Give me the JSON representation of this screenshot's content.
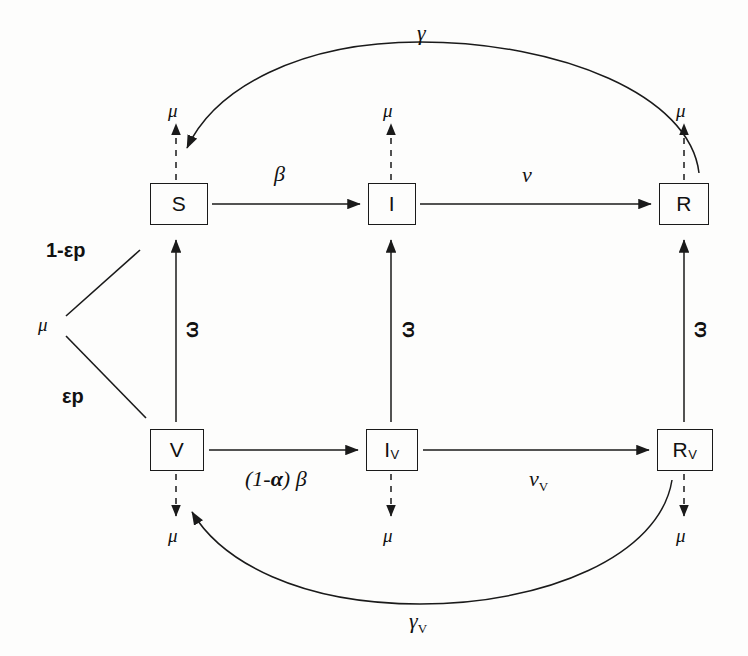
{
  "diagram": {
    "type": "compartmental-flow",
    "stroke_color": "#1a1a1a",
    "background_color": "#fdfdfc",
    "nodes": [
      {
        "id": "S",
        "label": "S",
        "sub": "",
        "x": 150,
        "y": 183,
        "w": 56,
        "h": 40
      },
      {
        "id": "I",
        "label": "I",
        "sub": "",
        "x": 368,
        "y": 183,
        "w": 46,
        "h": 40
      },
      {
        "id": "R",
        "label": "R",
        "sub": "",
        "x": 659,
        "y": 183,
        "w": 48,
        "h": 40
      },
      {
        "id": "V",
        "label": "V",
        "sub": "",
        "x": 150,
        "y": 429,
        "w": 52,
        "h": 40
      },
      {
        "id": "IV",
        "label": "I",
        "sub": "V",
        "x": 366,
        "y": 429,
        "w": 50,
        "h": 40
      },
      {
        "id": "RV",
        "label": "R",
        "sub": "V",
        "x": 657,
        "y": 429,
        "w": 54,
        "h": 40
      }
    ],
    "labels": {
      "birth_mu": "μ",
      "branch_unvaccinated": "1-εp",
      "branch_vaccinated": "εp",
      "infection_top": "β",
      "infection_bottom_prefix": "(1-",
      "infection_bottom_alpha": "α",
      "infection_bottom_suffix": ") ",
      "infection_bottom_beta": "β",
      "recovery_top": "ν",
      "recovery_bottom": "ν",
      "recovery_bottom_sub": "V",
      "waning_top": "γ",
      "waning_bottom": "γ",
      "waning_bottom_sub": "V",
      "vaccine_waning": "ω",
      "death_mu": "μ"
    },
    "death_labels": [
      {
        "for": "S",
        "text": "μ",
        "x": 167,
        "y": 103
      },
      {
        "for": "I",
        "text": "μ",
        "x": 385,
        "y": 103
      },
      {
        "for": "R",
        "text": "μ",
        "x": 676,
        "y": 103
      },
      {
        "for": "V",
        "text": "μ",
        "x": 167,
        "y": 528
      },
      {
        "for": "IV",
        "text": "μ",
        "x": 385,
        "y": 528
      },
      {
        "for": "RV",
        "text": "μ",
        "x": 676,
        "y": 528
      }
    ],
    "waning_labels": [
      {
        "for": "S-V",
        "text": "ω",
        "x": 183,
        "y": 325
      },
      {
        "for": "I-IV",
        "text": "ω",
        "x": 401,
        "y": 325
      },
      {
        "for": "R-RV",
        "text": "ω",
        "x": 692,
        "y": 325
      }
    ],
    "edges": [
      {
        "from": "birth",
        "to": "S",
        "rate": "1-εp",
        "style": "solid-line"
      },
      {
        "from": "birth",
        "to": "V",
        "rate": "εp",
        "style": "solid-line"
      },
      {
        "from": "S",
        "to": "I",
        "rate": "β",
        "style": "arrow"
      },
      {
        "from": "I",
        "to": "R",
        "rate": "ν",
        "style": "arrow"
      },
      {
        "from": "V",
        "to": "IV",
        "rate": "(1-α)β",
        "style": "arrow"
      },
      {
        "from": "IV",
        "to": "RV",
        "rate": "ν_V",
        "style": "arrow"
      },
      {
        "from": "V",
        "to": "S",
        "rate": "ω",
        "style": "arrow-up"
      },
      {
        "from": "IV",
        "to": "I",
        "rate": "ω",
        "style": "arrow-up"
      },
      {
        "from": "RV",
        "to": "R",
        "rate": "ω",
        "style": "arrow-up"
      },
      {
        "from": "R",
        "to": "S",
        "rate": "γ",
        "style": "curved-arrow"
      },
      {
        "from": "RV",
        "to": "V",
        "rate": "γ_V",
        "style": "curved-arrow"
      },
      {
        "from": "S",
        "to": "death",
        "rate": "μ",
        "style": "dashed-arrow"
      },
      {
        "from": "I",
        "to": "death",
        "rate": "μ",
        "style": "dashed-arrow"
      },
      {
        "from": "R",
        "to": "death",
        "rate": "μ",
        "style": "dashed-arrow"
      },
      {
        "from": "V",
        "to": "death",
        "rate": "μ",
        "style": "dashed-arrow"
      },
      {
        "from": "IV",
        "to": "death",
        "rate": "μ",
        "style": "dashed-arrow"
      },
      {
        "from": "RV",
        "to": "death",
        "rate": "μ",
        "style": "dashed-arrow"
      }
    ]
  }
}
